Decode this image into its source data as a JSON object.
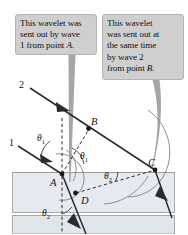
{
  "figure": {
    "background_color": "#ffffff",
    "media": {
      "upper_label": "incident medium",
      "lower_label": "refracting medium",
      "lower_fill": "#e4e8ee",
      "lowest_fill": "#dfe4eb",
      "border_color": "#a9a9a9"
    }
  },
  "callouts": [
    {
      "id": "callout-1",
      "lines": [
        "This wavelet was",
        "sent out by wave",
        "1 from point "
      ],
      "emphasis": "A.",
      "full_text": "This wavelet was sent out by wave 1 from point A.",
      "fill": "#cfcfcf",
      "border": "#b4b4b4",
      "pointer_target": "wavelet-A-arc"
    },
    {
      "id": "callout-2",
      "lines": [
        "This wavelet",
        "was sent out at",
        "the same time",
        "by wave 2",
        "from point "
      ],
      "emphasis": "B.",
      "full_text": "This wavelet was sent out at the same time by wave 2 from point B.",
      "fill": "#cfcfcf",
      "border": "#b4b4b4",
      "pointer_target": "wavelet-B-arc"
    }
  ],
  "labels": {
    "wave_1": "1",
    "wave_2": "2",
    "point_A": "A",
    "point_B": "B",
    "point_C": "C",
    "point_D": "D",
    "theta_1_upper": "θ",
    "theta_1_sub": "1",
    "theta_2_sub": "2"
  },
  "angles": [
    {
      "name": "theta-1-incident",
      "symbol": "θ",
      "subscript": "1",
      "x": 37,
      "y": 139
    },
    {
      "name": "theta-1-construction",
      "symbol": "θ",
      "subscript": "1",
      "x": 80,
      "y": 157
    },
    {
      "name": "theta-2-construction",
      "symbol": "θ",
      "subscript": "2",
      "x": 104,
      "y": 177
    },
    {
      "name": "theta-2-refracted",
      "symbol": "θ",
      "subscript": "2",
      "x": 43,
      "y": 214
    }
  ],
  "points": [
    {
      "name": "point-A",
      "label": "A",
      "x": 62,
      "y": 174,
      "label_x": 51,
      "label_y": 185
    },
    {
      "name": "point-B",
      "label": "B",
      "x": 88,
      "y": 128,
      "label_x": 90,
      "label_y": 124
    },
    {
      "name": "point-C",
      "label": "C",
      "x": 155,
      "y": 170,
      "label_x": 151,
      "label_y": 166
    },
    {
      "name": "point-D",
      "label": "D",
      "x": 76,
      "y": 193,
      "label_x": 80,
      "label_y": 204
    }
  ],
  "rays": [
    {
      "name": "incident-ray-1",
      "label": "1",
      "from": [
        18,
        146
      ],
      "to": [
        62,
        174
      ]
    },
    {
      "name": "incident-ray-2",
      "label": "2",
      "from": [
        30,
        88
      ],
      "to": [
        155,
        170
      ]
    },
    {
      "name": "refracted-ray-1",
      "from": [
        62,
        174
      ],
      "to": [
        86,
        234
      ]
    },
    {
      "name": "refracted-ray-2",
      "from": [
        155,
        170
      ],
      "to": [
        170,
        214
      ]
    }
  ],
  "colors": {
    "ray": "#2b2b2b",
    "arc": "#8a8a8a",
    "pointer": "#9a9a9a",
    "dashed": "#2b2b2b",
    "text": "#111111"
  }
}
